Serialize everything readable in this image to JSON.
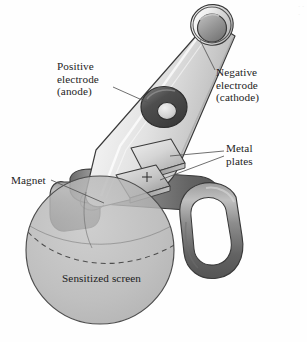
{
  "figure": {
    "name": "cathode-ray-tube-diagram",
    "background_color": "#fefefe",
    "ink_color": "#1d1d1d",
    "leader_line_color": "#555555"
  },
  "labels": {
    "positive_electrode": {
      "line1": "Positive",
      "line2": "electrode",
      "line3": "(anode)"
    },
    "negative_electrode": {
      "line1": "Negative",
      "line2": "electrode",
      "line3": "(cathode)"
    },
    "metal_plates": {
      "line1": "Metal",
      "line2": "plates"
    },
    "magnet": {
      "line1": "Magnet"
    },
    "sensitized_screen": {
      "line1": "Sensitized screen"
    }
  },
  "markings": {
    "plate_polarity": "+"
  },
  "edge_artifact": {
    "text": "· · ·"
  },
  "colors": {
    "tube_glass_light": "#f2f2f2",
    "tube_glass_mid": "#d9d9d9",
    "tube_glass_shadow": "#bfbfbf",
    "electrode_dark": "#4a4a4a",
    "electrode_mid": "#8a8a8a",
    "electrode_light": "#cfcfcf",
    "magnet_dark": "#5e5e5e",
    "magnet_mid": "#8f8f8f",
    "magnet_light": "#b8b8b8",
    "plate_light": "#e6e6e6",
    "plate_mid": "#c4c4c4",
    "plate_shadow": "#9e9e9e",
    "screen_fill": "#b0b0b0",
    "screen_stroke": "#4d4d4d",
    "outline": "#3a3a3a"
  }
}
